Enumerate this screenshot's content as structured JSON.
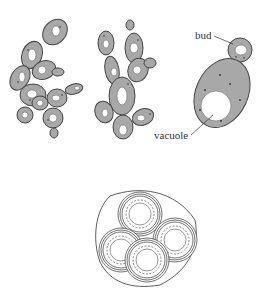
{
  "figure": {
    "labels": {
      "bud": "bud",
      "vacuole": "vacuole"
    },
    "colors": {
      "cytoplasm": "#a8a8a8",
      "outline": "#444444",
      "vacuole": "#ffffff",
      "background": "#ffffff"
    },
    "panels": [
      {
        "name": "branched-budding-chain-left"
      },
      {
        "name": "branched-budding-chain-middle"
      },
      {
        "name": "single-budding-cell-labeled"
      },
      {
        "name": "ascus-with-four-spores"
      }
    ]
  }
}
